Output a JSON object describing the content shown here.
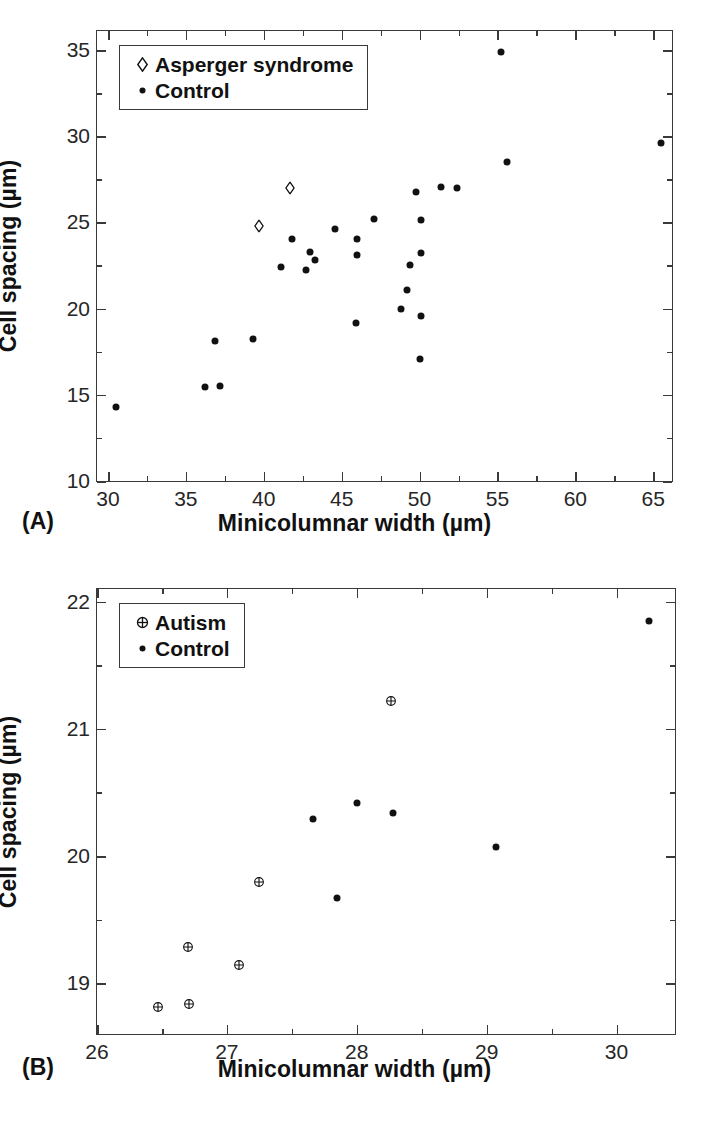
{
  "figure": {
    "panels": [
      {
        "id": "A",
        "label": "(A)",
        "xlabel": "Minicolumnar width (µm)",
        "ylabel": "Cell spacing (µm)",
        "legend": [
          {
            "marker": "open-diamond",
            "label": "Asperger syndrome"
          },
          {
            "marker": "filled-dot",
            "label": "Control"
          }
        ],
        "xticks": [
          "30",
          "35",
          "40",
          "45",
          "50",
          "55",
          "60",
          "65"
        ],
        "yticks": [
          "10",
          "15",
          "20",
          "25",
          "30",
          "35"
        ]
      },
      {
        "id": "B",
        "label": "(B)",
        "xlabel": "Minicolumnar width (µm)",
        "ylabel": "Cell spacing (µm)",
        "legend": [
          {
            "marker": "circle-plus",
            "label": "Autism"
          },
          {
            "marker": "filled-dot",
            "label": "Control"
          }
        ],
        "xticks": [
          "26",
          "27",
          "28",
          "29",
          "30"
        ],
        "yticks": [
          "19",
          "20",
          "21",
          "22"
        ]
      }
    ]
  },
  "chart_data": [
    {
      "type": "scatter",
      "panel": "A",
      "title": "",
      "xlabel": "Minicolumnar width (µm)",
      "ylabel": "Cell spacing (µm)",
      "xlim": [
        29.3,
        66.2
      ],
      "ylim": [
        10,
        36.1
      ],
      "xticks": [
        30,
        35,
        40,
        45,
        50,
        55,
        60,
        65
      ],
      "yticks": [
        10,
        15,
        20,
        25,
        30,
        35
      ],
      "minor_tick_step_x": 2.5,
      "minor_tick_step_y": 2.5,
      "grid": false,
      "legend_position": "top-left",
      "series": [
        {
          "name": "Asperger syndrome",
          "marker": "open-diamond",
          "color": "#111111",
          "points": [
            {
              "x": 39.7,
              "y": 24.85
            },
            {
              "x": 41.7,
              "y": 27.05
            }
          ]
        },
        {
          "name": "Control",
          "marker": "filled-dot",
          "color": "#111111",
          "points": [
            {
              "x": 30.5,
              "y": 14.3
            },
            {
              "x": 36.2,
              "y": 15.45
            },
            {
              "x": 37.2,
              "y": 15.5
            },
            {
              "x": 36.9,
              "y": 18.1
            },
            {
              "x": 39.3,
              "y": 18.25
            },
            {
              "x": 41.1,
              "y": 22.4
            },
            {
              "x": 41.8,
              "y": 24.05
            },
            {
              "x": 42.7,
              "y": 22.25
            },
            {
              "x": 43.0,
              "y": 23.3
            },
            {
              "x": 43.3,
              "y": 22.8
            },
            {
              "x": 44.6,
              "y": 24.6
            },
            {
              "x": 45.9,
              "y": 19.15
            },
            {
              "x": 46.0,
              "y": 23.1
            },
            {
              "x": 46.0,
              "y": 24.05
            },
            {
              "x": 47.1,
              "y": 25.2
            },
            {
              "x": 48.8,
              "y": 19.95
            },
            {
              "x": 49.2,
              "y": 21.05
            },
            {
              "x": 49.4,
              "y": 22.55
            },
            {
              "x": 49.8,
              "y": 26.75
            },
            {
              "x": 50.0,
              "y": 17.05
            },
            {
              "x": 50.1,
              "y": 19.55
            },
            {
              "x": 50.1,
              "y": 23.25
            },
            {
              "x": 50.1,
              "y": 25.15
            },
            {
              "x": 51.4,
              "y": 27.05
            },
            {
              "x": 52.4,
              "y": 27.0
            },
            {
              "x": 55.2,
              "y": 34.9
            },
            {
              "x": 55.6,
              "y": 28.5
            },
            {
              "x": 65.5,
              "y": 29.6
            }
          ]
        }
      ]
    },
    {
      "type": "scatter",
      "panel": "B",
      "title": "",
      "xlabel": "Minicolumnar width (µm)",
      "ylabel": "Cell spacing (µm)",
      "xlim": [
        26.0,
        30.45
      ],
      "ylim": [
        18.6,
        22.1
      ],
      "xticks": [
        26,
        27,
        28,
        29,
        30
      ],
      "yticks": [
        19,
        20,
        21,
        22
      ],
      "minor_tick_step_x": 0.5,
      "minor_tick_step_y": 0.5,
      "grid": false,
      "legend_position": "top-left",
      "series": [
        {
          "name": "Autism",
          "marker": "circle-plus",
          "color": "#111111",
          "points": [
            {
              "x": 26.47,
              "y": 18.82
            },
            {
              "x": 26.71,
              "y": 18.84
            },
            {
              "x": 26.7,
              "y": 19.29
            },
            {
              "x": 27.09,
              "y": 19.15
            },
            {
              "x": 27.25,
              "y": 19.8
            },
            {
              "x": 28.26,
              "y": 21.23
            }
          ]
        },
        {
          "name": "Control",
          "marker": "filled-dot",
          "color": "#111111",
          "points": [
            {
              "x": 27.66,
              "y": 20.29
            },
            {
              "x": 27.85,
              "y": 19.67
            },
            {
              "x": 28.0,
              "y": 20.42
            },
            {
              "x": 28.28,
              "y": 20.34
            },
            {
              "x": 29.07,
              "y": 20.07
            },
            {
              "x": 30.25,
              "y": 21.85
            }
          ]
        }
      ]
    }
  ]
}
